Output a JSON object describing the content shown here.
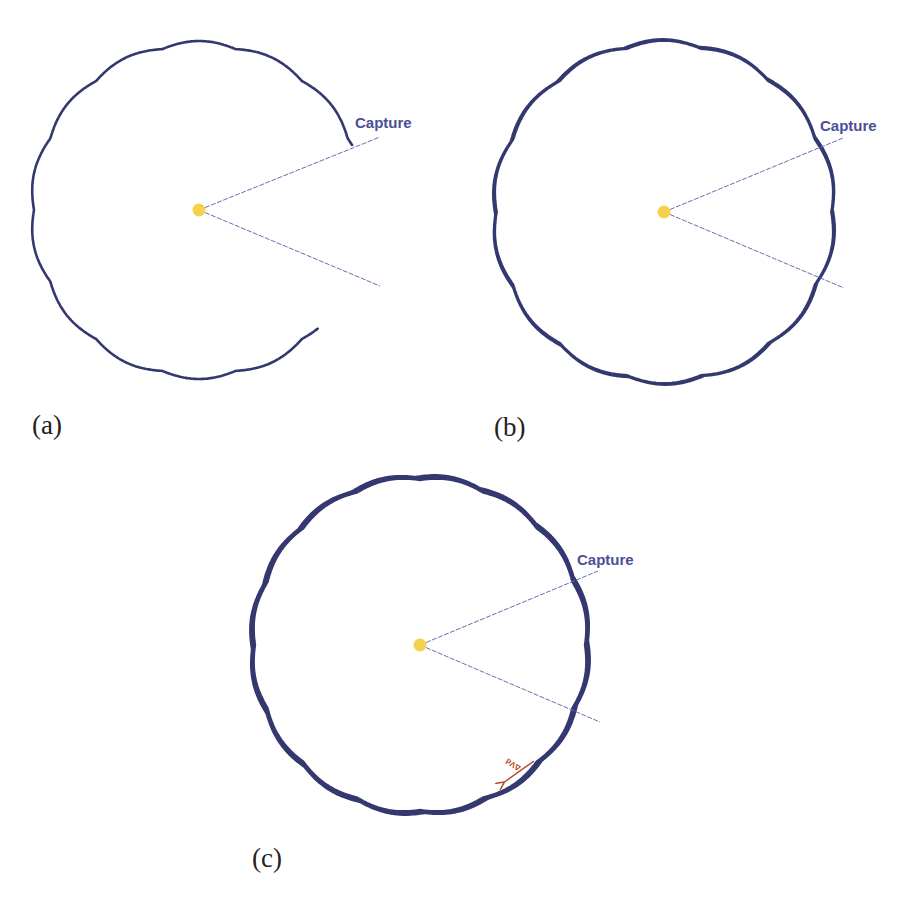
{
  "figure": {
    "colors": {
      "orbit": "#33386e",
      "capture_line": "#6a6fb0",
      "capture_text": "#4a4f96",
      "body": "#f6d24c",
      "delta_v": "#b5452a"
    },
    "panels": [
      {
        "id": "a",
        "label": "(a)",
        "label_pos": [
          32,
          434
        ],
        "center": [
          199,
          210
        ],
        "radius": 167,
        "ripples": 14,
        "ripple_amp": 4,
        "strands": 1,
        "start_angle_deg": -23,
        "sweep_deg": -292,
        "capture_text": "Capture",
        "capture_text_pos": [
          355,
          128
        ],
        "capture_line_upper_end": [
          380,
          137
        ],
        "capture_line_lower_end": [
          380,
          286
        ]
      },
      {
        "id": "b",
        "label": "(b)",
        "label_pos": [
          494,
          436
        ],
        "center": [
          664,
          212
        ],
        "radius": 170,
        "ripples": 14,
        "ripple_amp": 4,
        "strands": 2,
        "start_angle_deg": -23,
        "sweep_deg": -360,
        "capture_text": "Capture",
        "capture_text_pos": [
          820,
          131
        ],
        "capture_line_upper_end": [
          843,
          138
        ],
        "capture_line_lower_end": [
          844,
          288
        ]
      },
      {
        "id": "c",
        "label": "(c)",
        "label_pos": [
          252,
          867
        ],
        "center": [
          420,
          645
        ],
        "radius": 168,
        "ripples": 16,
        "ripple_amp": 3,
        "strands": 3,
        "start_angle_deg": -23,
        "sweep_deg": -360,
        "capture_text": "Capture",
        "capture_text_pos": [
          577,
          565
        ],
        "capture_line_upper_end": [
          598,
          571
        ],
        "capture_line_lower_end": [
          600,
          722
        ],
        "delta_v": {
          "text": "ΔVd",
          "arrow_from": [
            534,
            761
          ],
          "arrow_to": [
            503,
            783
          ],
          "text_pos": [
            505,
            768
          ],
          "text_rotate_deg": -148
        }
      }
    ]
  }
}
